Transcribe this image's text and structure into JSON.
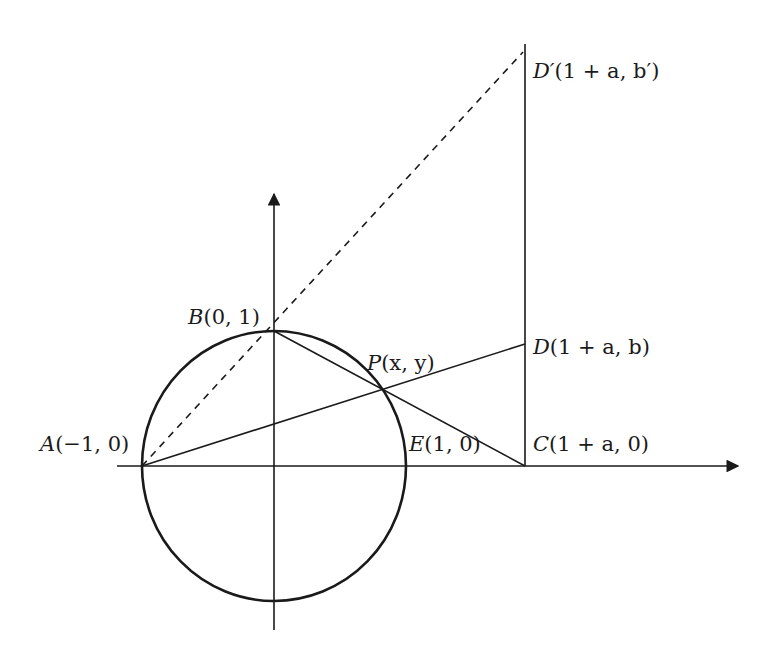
{
  "diagram": {
    "type": "geometry",
    "points": {
      "A": {
        "name": "A",
        "coords": "(−1, 0)"
      },
      "B": {
        "name": "B",
        "coords": "(0, 1)"
      },
      "E": {
        "name": "E",
        "coords": "(1, 0)"
      },
      "P": {
        "name": "P",
        "coords": "(x, y)"
      },
      "C": {
        "name": "C",
        "coords": "(1 + a, 0)"
      },
      "D": {
        "name": "D",
        "coords": "(1 + a, b)"
      },
      "Dp": {
        "name": "D′",
        "coords": "(1 + a, b′)"
      }
    },
    "segments": [
      {
        "from": "A",
        "to": "D",
        "style": "solid"
      },
      {
        "from": "B",
        "to": "C",
        "style": "solid"
      },
      {
        "from": "A",
        "to": "D′",
        "style": "dashed"
      },
      {
        "from": "C",
        "to": "top",
        "style": "solid",
        "note": "vertical line x = 1 + a"
      }
    ],
    "colors": {
      "stroke": "#1a1a1a",
      "background": "#ffffff"
    }
  }
}
